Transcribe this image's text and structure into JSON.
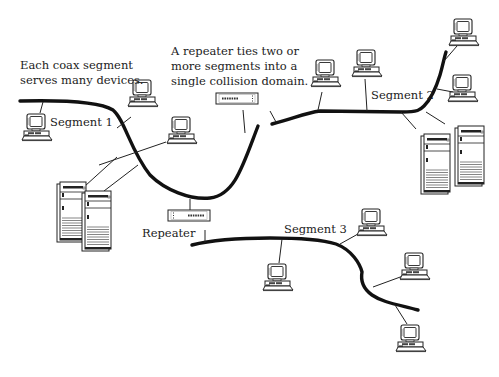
{
  "annotations": {
    "coax_note_line1": "Each coax segment",
    "coax_note_line2": "serves many devices.",
    "repeater_note_line1": "A repeater ties two or",
    "repeater_note_line2": "more segments into a",
    "repeater_note_line3": "single collision domain."
  },
  "labels": {
    "segment1": "Segment 1",
    "segment2": "Segment 2",
    "segment3": "Segment 3",
    "repeater": "Repeater"
  },
  "segments": [
    {
      "name": "Segment 1",
      "devices": 5,
      "device_types": [
        "workstation",
        "workstation",
        "workstation",
        "server",
        "server"
      ]
    },
    {
      "name": "Segment 2",
      "devices": 6,
      "device_types": [
        "workstation",
        "workstation",
        "workstation",
        "workstation",
        "server",
        "server"
      ]
    },
    {
      "name": "Segment 3",
      "devices": 4,
      "device_types": [
        "workstation",
        "workstation",
        "workstation",
        "workstation"
      ]
    }
  ],
  "repeaters": [
    {
      "connects": [
        "Segment 1",
        "Segment 2"
      ]
    },
    {
      "connects": [
        "Segment 1",
        "Segment 3"
      ]
    }
  ],
  "colors": {
    "line": "#111111",
    "background": "#ffffff",
    "text": "#1c1c1c"
  }
}
